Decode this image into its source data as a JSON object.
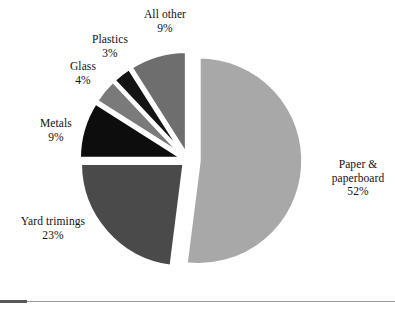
{
  "chart_data": {
    "type": "pie",
    "title": "",
    "subtitle": "",
    "xlabel": "",
    "ylabel": "",
    "legend_position": "none",
    "grid": false,
    "units": "percent",
    "exploded": true,
    "start_angle_deg": 0,
    "direction": "clockwise",
    "total": 100,
    "categories": [
      "Paper & paperboard",
      "Yard trimings",
      "Metals",
      "Glass",
      "Plastics",
      "All other"
    ],
    "values": [
      52,
      23,
      9,
      4,
      3,
      9
    ],
    "colors": [
      "#a8a8a8",
      "#4a4a4a",
      "#0d0d0d",
      "#7a7a7a",
      "#141414",
      "#6e6e6e"
    ],
    "slices": [
      {
        "name": "Paper & paperboard",
        "label_line1": "Paper &",
        "label_line2": "paperboard",
        "value": 52,
        "value_text": "52%",
        "color": "#a8a8a8",
        "start_deg": 0,
        "end_deg": 187.2,
        "explode": 11
      },
      {
        "name": "Yard trimings",
        "label_line1": "Yard trimings",
        "label_line2": "",
        "value": 23,
        "value_text": "23%",
        "color": "#4a4a4a",
        "start_deg": 187.2,
        "end_deg": 270,
        "explode": 5
      },
      {
        "name": "Metals",
        "label_line1": "Metals",
        "label_line2": "",
        "value": 9,
        "value_text": "9%",
        "color": "#0d0d0d",
        "start_deg": 270,
        "end_deg": 302.4,
        "explode": 5
      },
      {
        "name": "Glass",
        "label_line1": "Glass",
        "label_line2": "",
        "value": 4,
        "value_text": "4%",
        "color": "#7a7a7a",
        "start_deg": 302.4,
        "end_deg": 316.8,
        "explode": 5
      },
      {
        "name": "Plastics",
        "label_line1": "Plastics",
        "label_line2": "",
        "value": 3,
        "value_text": "3%",
        "color": "#141414",
        "start_deg": 316.8,
        "end_deg": 327.6,
        "explode": 5
      },
      {
        "name": "All other",
        "label_line1": "All other",
        "label_line2": "",
        "value": 9,
        "value_text": "9%",
        "color": "#6e6e6e",
        "start_deg": 327.6,
        "end_deg": 360,
        "explode": 5
      }
    ]
  },
  "labels": {
    "all_other": {
      "name": "All other",
      "value": "9%"
    },
    "plastics": {
      "name": "Plastics",
      "value": "3%"
    },
    "glass": {
      "name": "Glass",
      "value": "4%"
    },
    "metals": {
      "name": "Metals",
      "value": "9%"
    },
    "yard_trimings": {
      "name": "Yard trimings",
      "value": "23%"
    },
    "paper": {
      "name_line1": "Paper &",
      "name_line2": "paperboard",
      "value": "52%"
    }
  },
  "figure": {
    "background": "#ffffff",
    "rule_dark_color": "#58585a",
    "rule_light_color": "#9a9a9c"
  }
}
